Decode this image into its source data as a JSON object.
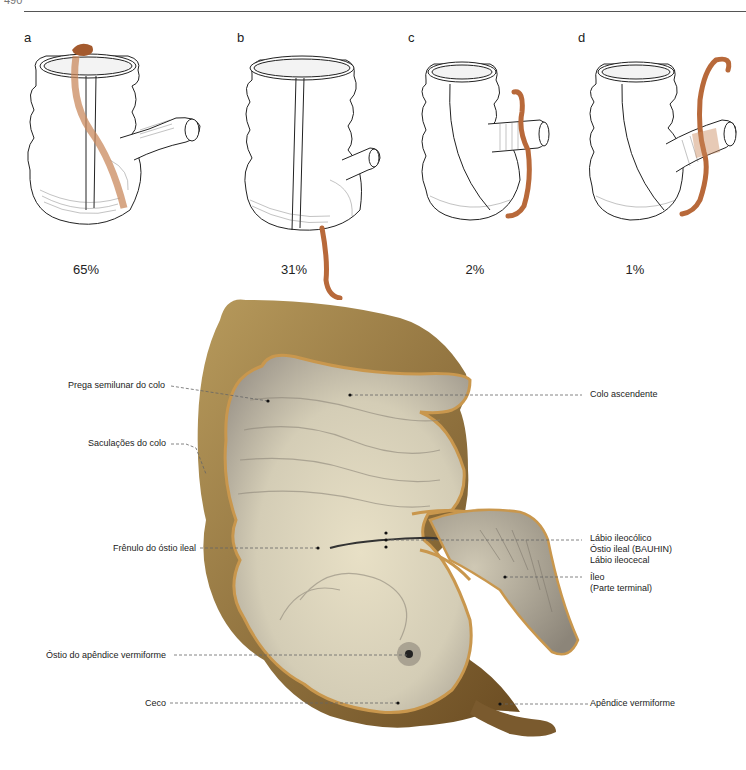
{
  "page": {
    "number": "490"
  },
  "panels": [
    {
      "letter": "a",
      "percentage": "65%",
      "description": "appendix retrocecal, ascending behind the cecum"
    },
    {
      "letter": "b",
      "percentage": "31%",
      "description": "appendix hanging down into the pelvis"
    },
    {
      "letter": "c",
      "percentage": "2%",
      "description": "appendix ascending behind the ileum"
    },
    {
      "letter": "d",
      "percentage": "1%",
      "description": "appendix ascending in front of the ileum"
    }
  ],
  "figure_e": {
    "letter": "e",
    "labels_left": [
      "Prega semilunar do colo",
      "Saculações do colo",
      "Frênulo do óstio ileal",
      "Óstio do apêndice vermiforme",
      "Ceco"
    ],
    "labels_right": [
      "Colo ascendente",
      "Lábio ileocólico",
      "Óstio ileal (BAUHIN)",
      "Lábio ileocecal",
      "Íleo",
      "(Parte terminal)",
      "Apêndice vermiforme"
    ]
  },
  "colors": {
    "appendix": "#b8693a",
    "mucosa": "#d9d3bf",
    "wall": "#8a6a3a",
    "rim": "#c9974d"
  }
}
